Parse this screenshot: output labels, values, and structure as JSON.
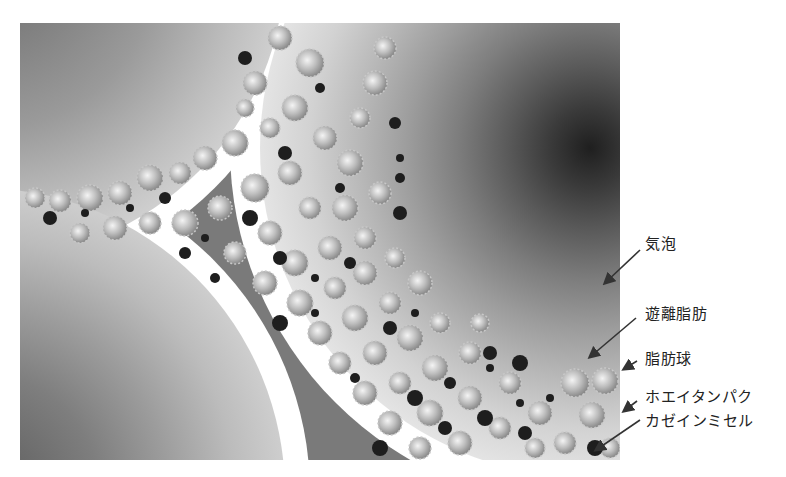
{
  "diagram": {
    "title": "",
    "colors": {
      "background": "#ffffff",
      "serum_phase": "#7a7a7a",
      "bubble_outer": "#e6e6e6",
      "bubble_inner": "#2a2a2a",
      "fat_globule": "#d9d9d9",
      "casein_micelle": "#1e1e1e"
    },
    "labels": [
      {
        "id": "air-bubble",
        "text": "気泡"
      },
      {
        "id": "free-fat",
        "text": "遊離脂肪"
      },
      {
        "id": "fat-globule",
        "text": "脂肪球"
      },
      {
        "id": "whey-protein",
        "text": "ホエイタンパク"
      },
      {
        "id": "casein-micelle",
        "text": "カゼインミセル"
      }
    ]
  }
}
